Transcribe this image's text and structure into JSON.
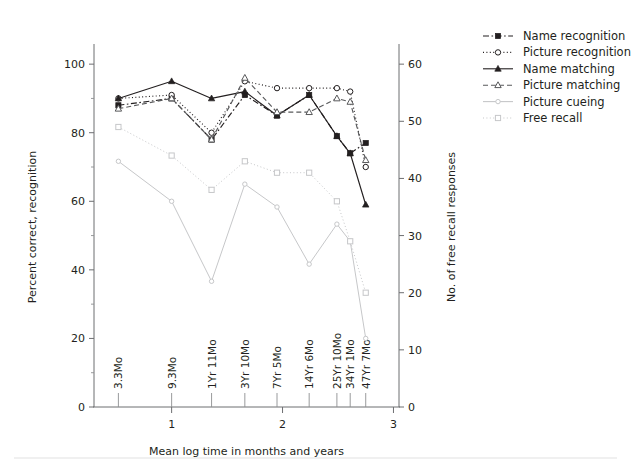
{
  "chart_data": {
    "type": "line",
    "title": "",
    "xlabel": "Mean log time in months and years",
    "ylabel": "Percent correct, recognition",
    "y2label": "No. of free recall responses",
    "grid": false,
    "legend_position": "right",
    "xlim": [
      0.3,
      3.05
    ],
    "ylim": [
      0,
      105
    ],
    "y2lim": [
      0,
      63
    ],
    "x_major_ticks": [
      "1",
      "2",
      "3"
    ],
    "x_major_values": [
      1,
      2,
      3
    ],
    "y_ticks": [
      "0",
      "20",
      "40",
      "60",
      "80",
      "100"
    ],
    "y_values": [
      0,
      20,
      40,
      60,
      80,
      100
    ],
    "y_minor_values": [
      10,
      30,
      50,
      70,
      90
    ],
    "y2_ticks": [
      "0",
      "10",
      "20",
      "30",
      "40",
      "50",
      "60"
    ],
    "y2_values": [
      0,
      10,
      20,
      30,
      40,
      50,
      60
    ],
    "categories": [
      "3.3Mo",
      "9.3Mo",
      "1Yr 11Mo",
      "3Yr 10Mo",
      "7Yr 5Mo",
      "14Yr 6Mo",
      "25Yr 10Mo",
      "34Yr 1Mo",
      "47Yr 7Mo"
    ],
    "x": [
      0.52,
      1.0,
      1.36,
      1.66,
      1.95,
      2.24,
      2.49,
      2.61,
      2.75
    ],
    "series": [
      {
        "name": "Name recognition",
        "axis": "left",
        "marker": "filled-square",
        "linestyle": "dash-dot",
        "color": "#231f20",
        "values": [
          88,
          90,
          78,
          91,
          85,
          91,
          79,
          74,
          77
        ]
      },
      {
        "name": "Picture recognition",
        "axis": "left",
        "marker": "open-circle",
        "linestyle": "dotted",
        "color": "#231f20",
        "values": [
          90,
          91,
          80,
          95,
          93,
          93,
          93,
          92,
          70
        ]
      },
      {
        "name": "Name matching",
        "axis": "left",
        "marker": "filled-triangle",
        "linestyle": "solid",
        "color": "#231f20",
        "values": [
          90,
          95,
          90,
          92,
          85,
          91,
          79,
          74,
          59
        ]
      },
      {
        "name": "Picture matching",
        "axis": "left",
        "marker": "open-triangle",
        "linestyle": "dashed",
        "color": "#58595b",
        "values": [
          87,
          90,
          78,
          96,
          86,
          86,
          90,
          89,
          72
        ]
      },
      {
        "name": "Picture cueing",
        "axis": "right",
        "marker": "small-circle",
        "linestyle": "solid",
        "color": "#c6c7c9",
        "values": [
          43,
          36,
          22,
          39,
          35,
          25,
          32,
          29,
          12
        ]
      },
      {
        "name": "Free recall",
        "axis": "right",
        "marker": "open-square",
        "linestyle": "dotted",
        "color": "#c6c7c9",
        "values": [
          49,
          44,
          38,
          43,
          41,
          41,
          36,
          29,
          20
        ]
      }
    ]
  },
  "legend": {
    "items": [
      {
        "label": "Name recognition"
      },
      {
        "label": "Picture recognition"
      },
      {
        "label": "Name matching"
      },
      {
        "label": "Picture matching"
      },
      {
        "label": "Picture cueing"
      },
      {
        "label": "Free recall"
      }
    ]
  }
}
